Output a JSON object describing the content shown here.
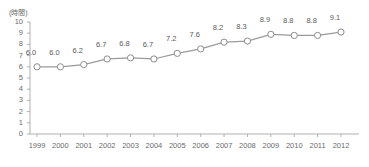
{
  "chart_data": {
    "type": "line",
    "title": "",
    "subtitle": "",
    "xlabel": "",
    "ylabel": "",
    "unit_label": "(時間)",
    "categories": [
      "1999",
      "2000",
      "2001",
      "2002",
      "2003",
      "2004",
      "2005",
      "2006",
      "2007",
      "2008",
      "2009",
      "2010",
      "2011",
      "2012"
    ],
    "values": [
      6.0,
      6.0,
      6.2,
      6.7,
      6.8,
      6.7,
      7.2,
      7.6,
      8.2,
      8.3,
      8.9,
      8.8,
      8.8,
      9.1
    ],
    "point_labels": [
      "6.0",
      "6.0",
      "6.2",
      "6.7",
      "6.8",
      "6.7",
      "7.2",
      "7.6",
      "8.2",
      "8.3",
      "8.9",
      "8.8",
      "8.8",
      "9.1"
    ],
    "ylim": [
      0,
      10
    ],
    "y_ticks": [
      0,
      1,
      2,
      3,
      4,
      5,
      6,
      7,
      8,
      9,
      10
    ],
    "y_tick_labels": [
      "0",
      "1",
      "2",
      "3",
      "4",
      "5",
      "6",
      "7",
      "8",
      "9",
      "10"
    ],
    "grid": false,
    "legend": "none",
    "series": [
      {
        "name": "series-1",
        "values": [
          6.0,
          6.0,
          6.2,
          6.7,
          6.8,
          6.7,
          7.2,
          7.6,
          8.2,
          8.3,
          8.9,
          8.8,
          8.8,
          9.1
        ],
        "line_color": "#9a9a9a",
        "marker": "open-circle",
        "marker_fill": "#ffffff",
        "marker_edge_color": "#8c8c8c"
      }
    ],
    "axis_color": "#b0b0b0",
    "text_color": "#6a6a6a",
    "background": "#ffffff"
  }
}
